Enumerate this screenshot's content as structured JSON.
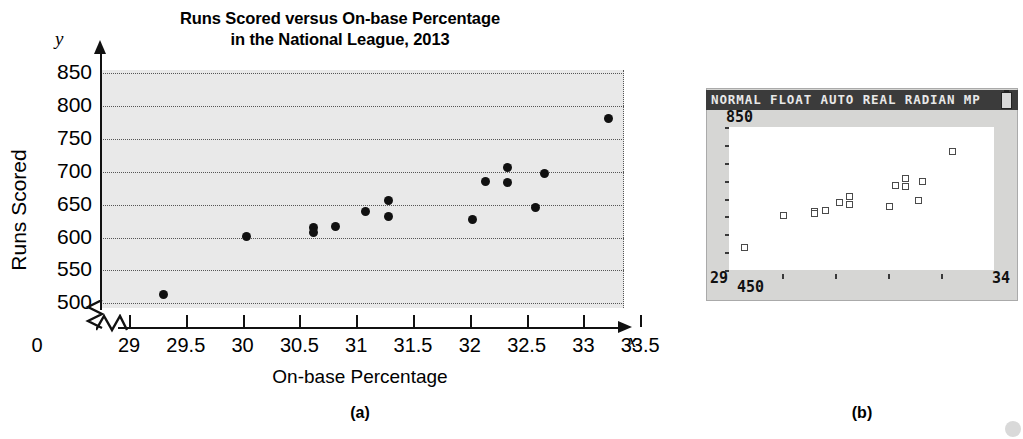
{
  "figure": {
    "panel_a_label": "(a)",
    "panel_b_label": "(b)"
  },
  "chart_data": [
    {
      "id": "panel-a-scatter",
      "type": "scatter",
      "title": "Runs Scored versus On-base Percentage",
      "title_line2": "in the National League, 2013",
      "xlabel": "On-base Percentage",
      "ylabel": "Runs Scored",
      "x_axis_variable": "x",
      "y_axis_variable": "y",
      "origin_label": "0",
      "grid": true,
      "legend": "none",
      "xlim": [
        28.75,
        33.6
      ],
      "ylim": [
        487,
        862
      ],
      "xticks": [
        29,
        29.5,
        30,
        30.5,
        31,
        31.5,
        32,
        32.5,
        33,
        33.5
      ],
      "xtick_labels": [
        "29",
        "29.5",
        "30",
        "30.5",
        "31",
        "31.5",
        "32",
        "32.5",
        "33",
        "33.5"
      ],
      "yticks": [
        500,
        550,
        600,
        650,
        700,
        750,
        800,
        850
      ],
      "ytick_labels": [
        "500",
        "550",
        "600",
        "650",
        "700",
        "750",
        "800",
        "850"
      ],
      "axis_break_x": true,
      "axis_break_y": true,
      "points": [
        {
          "x": 29.3,
          "y": 513
        },
        {
          "x": 30.03,
          "y": 602
        },
        {
          "x": 30.62,
          "y": 615
        },
        {
          "x": 30.62,
          "y": 607
        },
        {
          "x": 30.82,
          "y": 616
        },
        {
          "x": 31.08,
          "y": 639
        },
        {
          "x": 31.28,
          "y": 656
        },
        {
          "x": 31.28,
          "y": 632
        },
        {
          "x": 32.02,
          "y": 627
        },
        {
          "x": 32.14,
          "y": 685
        },
        {
          "x": 32.33,
          "y": 706
        },
        {
          "x": 32.33,
          "y": 683
        },
        {
          "x": 32.66,
          "y": 697
        },
        {
          "x": 32.58,
          "y": 645
        },
        {
          "x": 33.22,
          "y": 781
        }
      ]
    },
    {
      "id": "panel-b-calculator-scatter",
      "type": "scatter",
      "title": "",
      "status_bar": "NORMAL FLOAT AUTO REAL RADIAN MP",
      "ymax_label": "850",
      "ymin_label": "450",
      "xmin_label": "29",
      "xmax_label": "34",
      "xlim": [
        29,
        34
      ],
      "ylim": [
        450,
        850
      ],
      "grid": false,
      "points": [
        {
          "x": 29.3,
          "y": 513
        },
        {
          "x": 30.03,
          "y": 602
        },
        {
          "x": 30.62,
          "y": 615
        },
        {
          "x": 30.62,
          "y": 607
        },
        {
          "x": 30.82,
          "y": 616
        },
        {
          "x": 31.08,
          "y": 639
        },
        {
          "x": 31.28,
          "y": 656
        },
        {
          "x": 31.28,
          "y": 632
        },
        {
          "x": 32.02,
          "y": 627
        },
        {
          "x": 32.14,
          "y": 685
        },
        {
          "x": 32.33,
          "y": 706
        },
        {
          "x": 32.33,
          "y": 683
        },
        {
          "x": 32.66,
          "y": 697
        },
        {
          "x": 32.58,
          "y": 645
        },
        {
          "x": 33.22,
          "y": 781
        }
      ]
    }
  ],
  "colors": {
    "plot_background": "#e9e9e9",
    "marker": "#111111",
    "gridline": "#555555",
    "axis": "#111111",
    "calc_screen": "#d6d6d4",
    "calc_statusbar": "#3b3b3b",
    "calc_plot_background": "#ffffff",
    "calc_marker_outline": "#4a4a4a"
  }
}
